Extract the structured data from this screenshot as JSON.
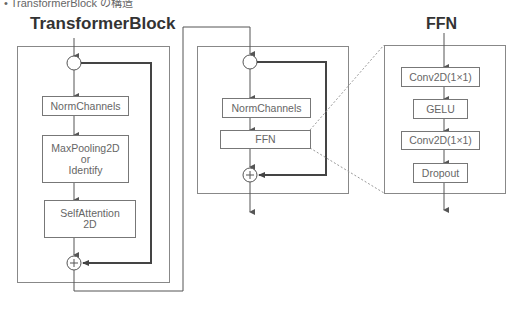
{
  "caption": "• TransformerBlock の構造",
  "transformer_block": {
    "title": "TransformerBlock",
    "nodes": [
      "NormChannels",
      "MaxPooling2D\nor\nIdentify",
      "SelfAttention\n2D"
    ],
    "norm_label": "NormChannels",
    "pool_line1": "MaxPooling2D",
    "pool_line2": "or",
    "pool_line3": "Identify",
    "attn_line1": "SelfAttention",
    "attn_line2": "2D",
    "add_symbol": "+"
  },
  "middle_block": {
    "nodes": [
      "NormChannels",
      "FFN"
    ],
    "norm_label": "NormChannels",
    "ffn_label": "FFN",
    "add_symbol": "+"
  },
  "ffn_block": {
    "title": "FFN",
    "nodes": [
      "Conv2D(1×1)",
      "GELU",
      "Conv2D(1×1)",
      "Dropout"
    ],
    "conv1_label": "Conv2D(1×1)",
    "gelu_label": "GELU",
    "conv2_label": "Conv2D(1×1)",
    "dropout_label": "Dropout"
  },
  "colors": {
    "line": "#555555",
    "skip_line": "#444444",
    "frame": "#888888",
    "dotted": "#999999",
    "title_text": "#333333",
    "box_text": "#666666"
  }
}
